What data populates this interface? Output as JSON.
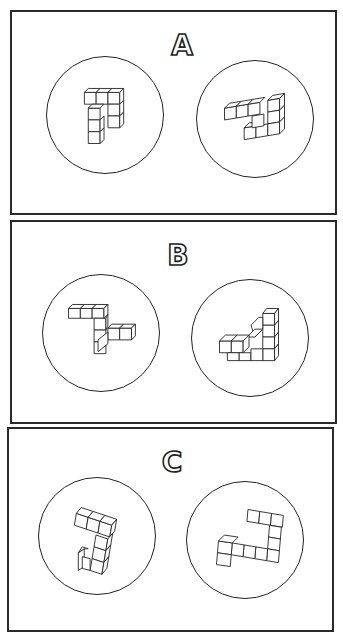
{
  "panels": [
    {
      "label": "A",
      "pair": [
        {
          "name": "figure-a-left",
          "description": "cube assembly shaped like an inverted L / '7' with a vertical arm"
        },
        {
          "name": "figure-a-right",
          "description": "cube assembly rotated, folded L-shape"
        }
      ]
    },
    {
      "label": "B",
      "pair": [
        {
          "name": "figure-b-left",
          "description": "Z-shaped cube assembly"
        },
        {
          "name": "figure-b-right",
          "description": "triangular / staircase cube assembly"
        }
      ]
    },
    {
      "label": "C",
      "pair": [
        {
          "name": "figure-c-left",
          "description": "hook-shaped cube assembly"
        },
        {
          "name": "figure-c-right",
          "description": "J-shaped cube assembly"
        }
      ]
    }
  ],
  "colors": {
    "ink": "#222222",
    "paper": "#ffffff"
  }
}
